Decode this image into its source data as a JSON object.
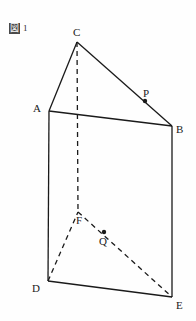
{
  "figure": {
    "caption_symbol": "図",
    "caption_number": "1",
    "background_color": "#fefefe",
    "line_color": "#1a1a1a"
  },
  "labels": {
    "A": "A",
    "B": "B",
    "C": "C",
    "D": "D",
    "E": "E",
    "F": "F",
    "P": "P",
    "Q": "Q"
  },
  "geometry": {
    "description": "triangular prism",
    "vertices": {
      "A": [
        49,
        111
      ],
      "B": [
        172,
        126
      ],
      "C": [
        77,
        42
      ],
      "D": [
        48,
        281
      ],
      "E": [
        172,
        297
      ],
      "F": [
        78,
        212
      ]
    },
    "points": {
      "P": [
        145,
        101
      ],
      "Q": [
        104,
        232
      ]
    },
    "solid_edges": [
      [
        "C",
        "A"
      ],
      [
        "C",
        "B"
      ],
      [
        "A",
        "B"
      ],
      [
        "A",
        "D"
      ],
      [
        "B",
        "E"
      ],
      [
        "D",
        "E"
      ]
    ],
    "dashed_edges": [
      [
        "C",
        "F"
      ],
      [
        "D",
        "F"
      ],
      [
        "F",
        "E"
      ]
    ]
  }
}
